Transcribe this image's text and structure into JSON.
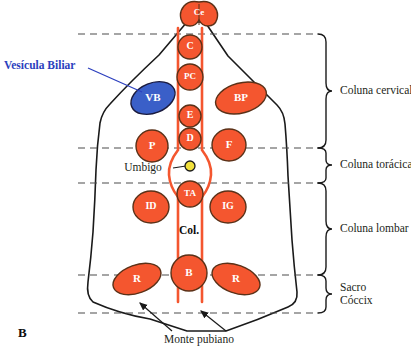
{
  "figure": {
    "panel_letter": "B",
    "background_color": "#ffffff",
    "organ_fill": "#f4562f",
    "organ_stroke": "#5a3118",
    "gallbladder_fill": "#3a5fc8",
    "gallbladder_stroke": "#1a1a3d",
    "spine_rail_color": "#f4562f",
    "navel_fill": "#f2e13c",
    "navel_stroke": "#1a1a1a",
    "body_outline_color": "#1a1a1a",
    "dashed_line_color": "#4d4d4d",
    "callout_blue": "#2b3fbe",
    "text_color": "#231f20"
  },
  "organs": [
    {
      "code": "Ce",
      "shape": "brain",
      "cx": 199,
      "cy": 13,
      "rx": 17,
      "ry": 13,
      "rot": 0,
      "font": 9,
      "fill": "#f4562f"
    },
    {
      "code": "C",
      "shape": "circle",
      "cx": 190,
      "cy": 47,
      "rx": 12,
      "ry": 12,
      "rot": 0,
      "font": 10,
      "fill": "#f4562f"
    },
    {
      "code": "PC",
      "shape": "circle",
      "cx": 190,
      "cy": 77,
      "rx": 13,
      "ry": 13,
      "rot": 0,
      "font": 9,
      "fill": "#f4562f"
    },
    {
      "code": "E",
      "shape": "circle",
      "cx": 190,
      "cy": 116,
      "rx": 11,
      "ry": 11,
      "rot": 0,
      "font": 10,
      "fill": "#f4562f"
    },
    {
      "code": "D",
      "shape": "circle",
      "cx": 190,
      "cy": 139,
      "rx": 11,
      "ry": 11,
      "rot": 0,
      "font": 10,
      "fill": "#f4562f"
    },
    {
      "code": "VB",
      "shape": "ellipse",
      "cx": 153,
      "cy": 98,
      "rx": 23,
      "ry": 15,
      "rot": -22,
      "font": 11,
      "fill": "#3a5fc8"
    },
    {
      "code": "BP",
      "shape": "ellipse",
      "cx": 241,
      "cy": 98,
      "rx": 26,
      "ry": 15,
      "rot": -15,
      "font": 11,
      "fill": "#f4562f"
    },
    {
      "code": "P",
      "shape": "circle",
      "cx": 152,
      "cy": 146,
      "rx": 16,
      "ry": 16,
      "rot": 0,
      "font": 11,
      "fill": "#f4562f"
    },
    {
      "code": "F",
      "shape": "circle",
      "cx": 229,
      "cy": 145,
      "rx": 17,
      "ry": 16,
      "rot": 0,
      "font": 11,
      "fill": "#f4562f"
    },
    {
      "code": "TA",
      "shape": "circle",
      "cx": 190,
      "cy": 194,
      "rx": 13,
      "ry": 13,
      "rot": 0,
      "font": 9,
      "fill": "#f4562f"
    },
    {
      "code": "ID",
      "shape": "circle",
      "cx": 151,
      "cy": 207,
      "rx": 18,
      "ry": 16,
      "rot": 0,
      "font": 10,
      "fill": "#f4562f"
    },
    {
      "code": "IG",
      "shape": "circle",
      "cx": 228,
      "cy": 207,
      "rx": 18,
      "ry": 16,
      "rot": 0,
      "font": 10,
      "fill": "#f4562f"
    },
    {
      "code": "R",
      "shape": "ellipse",
      "cx": 137,
      "cy": 279,
      "rx": 25,
      "ry": 14,
      "rot": -20,
      "font": 11,
      "fill": "#f4562f"
    },
    {
      "code": "B",
      "shape": "circle",
      "cx": 189,
      "cy": 273,
      "rx": 18,
      "ry": 18,
      "rot": 0,
      "font": 11,
      "fill": "#f4562f"
    },
    {
      "code": "R",
      "shape": "ellipse",
      "cx": 236,
      "cy": 279,
      "rx": 25,
      "ry": 14,
      "rot": 20,
      "font": 11,
      "fill": "#f4562f"
    }
  ],
  "spine": {
    "column_label": "Col.",
    "column_label_x": 189,
    "column_label_y": 231
  },
  "callouts": {
    "gallbladder": {
      "text": "Vesícula Biliar",
      "text_x": 4,
      "text_y": 66,
      "line": [
        [
          88,
          68
        ],
        [
          142,
          92
        ]
      ]
    },
    "navel": {
      "text": "Umbigo",
      "text_x": 143,
      "text_y": 168,
      "dot_x": 190,
      "dot_y": 166,
      "dot_r": 5,
      "line": [
        [
          173,
          168
        ],
        [
          186,
          166
        ]
      ]
    },
    "pubic_mound": {
      "text": "Monte pubiano",
      "text_x": 199,
      "text_y": 340,
      "arrows": [
        [
          [
            172,
            331
          ],
          [
            140,
            303
          ]
        ],
        [
          [
            226,
            331
          ],
          [
            201,
            311
          ]
        ]
      ]
    }
  },
  "brackets": [
    {
      "label": "Coluna cervical",
      "y_top": 34,
      "y_bottom": 148,
      "label_x": 340,
      "label_y": 91
    },
    {
      "label": "Coluna torácica",
      "y_top": 148,
      "y_bottom": 183,
      "label_x": 340,
      "label_y": 165
    },
    {
      "label": "Coluna lombar",
      "y_top": 183,
      "y_bottom": 275,
      "label_x": 340,
      "label_y": 229
    },
    {
      "label": "Sacro",
      "y_top": 275,
      "y_bottom": 313,
      "label_x": 340,
      "label_y": 288
    },
    {
      "label": "Cóccix",
      "y_top": null,
      "y_bottom": null,
      "label_x": 340,
      "label_y": 301
    }
  ],
  "dashed_lines": [
    {
      "y": 34,
      "x1": 78,
      "x2": 317
    },
    {
      "y": 148,
      "x1": 78,
      "x2": 317
    },
    {
      "y": 183,
      "x1": 78,
      "x2": 317
    },
    {
      "y": 275,
      "x1": 78,
      "x2": 317
    },
    {
      "y": 313,
      "x1": 78,
      "x2": 317
    }
  ]
}
